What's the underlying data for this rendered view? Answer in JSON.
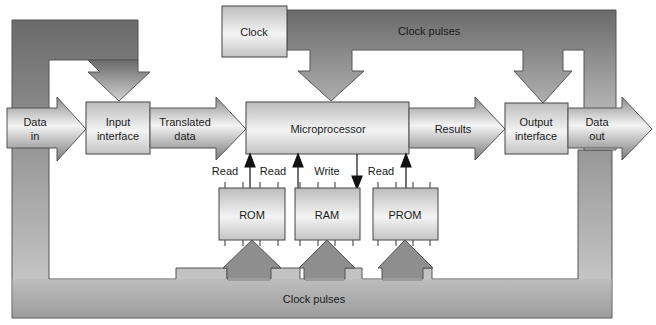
{
  "diagram": {
    "blocks": {
      "clock": "Clock",
      "input_interface": [
        "Input",
        "interface"
      ],
      "microprocessor": "Microprocessor",
      "output_interface": [
        "Output",
        "interface"
      ],
      "rom": "ROM",
      "ram": "RAM",
      "prom": "PROM"
    },
    "arrows": {
      "data_in": [
        "Data",
        "in"
      ],
      "translated_data": [
        "Translated",
        "data"
      ],
      "results": "Results",
      "data_out": [
        "Data",
        "out"
      ]
    },
    "bands": {
      "clock_pulses_top": "Clock pulses",
      "clock_pulses_bottom": "Clock pulses"
    },
    "signals": {
      "rom_read_left": "Read",
      "rom_read_right": "Read",
      "ram_write": "Write",
      "prom_read": "Read"
    },
    "colors": {
      "band_dark": "#6e6e6e",
      "band_light": "#cfcfcf",
      "box_light": "#f2f2f2",
      "box_dark": "#b9b9b9",
      "stroke": "#444444"
    }
  }
}
